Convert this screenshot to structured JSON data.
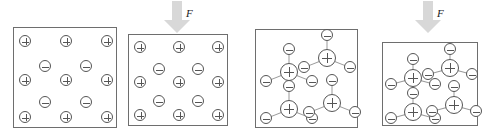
{
  "figure": {
    "background_color": "#ffffff",
    "box_border_color": "#6e6e6e",
    "charge_outline_color": "#555555",
    "bond_color": "#9a9a9a",
    "arrow_color": "#d8d8d8",
    "force_label": "F",
    "symbols": {
      "positive": "plus",
      "negative": "minus"
    }
  },
  "panels": [
    {
      "id": "panel-1",
      "name": "uncompressed-lattice",
      "x": 13,
      "y": 27,
      "width": 104,
      "height": 101,
      "type": "lattice",
      "charges": [
        {
          "sign": "plus",
          "cx": 11,
          "cy": 13,
          "r": 6
        },
        {
          "sign": "plus",
          "cx": 52,
          "cy": 13,
          "r": 6
        },
        {
          "sign": "plus",
          "cx": 93,
          "cy": 13,
          "r": 6
        },
        {
          "sign": "minus",
          "cx": 31,
          "cy": 38,
          "r": 6
        },
        {
          "sign": "minus",
          "cx": 72,
          "cy": 38,
          "r": 6
        },
        {
          "sign": "plus",
          "cx": 11,
          "cy": 52,
          "r": 6
        },
        {
          "sign": "plus",
          "cx": 52,
          "cy": 52,
          "r": 6
        },
        {
          "sign": "plus",
          "cx": 93,
          "cy": 52,
          "r": 6
        },
        {
          "sign": "minus",
          "cx": 31,
          "cy": 74,
          "r": 6
        },
        {
          "sign": "minus",
          "cx": 72,
          "cy": 74,
          "r": 6
        },
        {
          "sign": "plus",
          "cx": 11,
          "cy": 89,
          "r": 6
        },
        {
          "sign": "plus",
          "cx": 52,
          "cy": 89,
          "r": 6
        },
        {
          "sign": "plus",
          "cx": 93,
          "cy": 89,
          "r": 6
        }
      ]
    },
    {
      "id": "panel-2",
      "name": "compressed-lattice",
      "x": 128,
      "y": 34,
      "width": 100,
      "height": 92,
      "type": "lattice",
      "charges": [
        {
          "sign": "plus",
          "cx": 11,
          "cy": 12,
          "r": 6
        },
        {
          "sign": "plus",
          "cx": 50,
          "cy": 12,
          "r": 6
        },
        {
          "sign": "plus",
          "cx": 89,
          "cy": 12,
          "r": 6
        },
        {
          "sign": "minus",
          "cx": 30,
          "cy": 34,
          "r": 6
        },
        {
          "sign": "minus",
          "cx": 69,
          "cy": 34,
          "r": 6
        },
        {
          "sign": "plus",
          "cx": 11,
          "cy": 47,
          "r": 6
        },
        {
          "sign": "plus",
          "cx": 50,
          "cy": 47,
          "r": 6
        },
        {
          "sign": "plus",
          "cx": 89,
          "cy": 47,
          "r": 6
        },
        {
          "sign": "minus",
          "cx": 30,
          "cy": 66,
          "r": 6
        },
        {
          "sign": "minus",
          "cx": 69,
          "cy": 66,
          "r": 6
        },
        {
          "sign": "plus",
          "cx": 11,
          "cy": 80,
          "r": 6
        },
        {
          "sign": "plus",
          "cx": 50,
          "cy": 80,
          "r": 6
        },
        {
          "sign": "plus",
          "cx": 89,
          "cy": 80,
          "r": 6
        }
      ]
    },
    {
      "id": "panel-3",
      "name": "uncompressed-molecules",
      "x": 255,
      "y": 29,
      "width": 103,
      "height": 99,
      "type": "molecules",
      "molecules": [
        {
          "cx": 33,
          "cy": 42,
          "r": 9,
          "ligands": [
            {
              "dx": 0,
              "dy": -23,
              "r": 6
            },
            {
              "dx": -23,
              "dy": 9,
              "r": 6
            },
            {
              "dx": 23,
              "dy": 9,
              "r": 6
            }
          ]
        },
        {
          "cx": 71,
          "cy": 28,
          "r": 9,
          "ligands": [
            {
              "dx": 0,
              "dy": -23,
              "r": 6
            },
            {
              "dx": -23,
              "dy": 9,
              "r": 6
            },
            {
              "dx": 23,
              "dy": 9,
              "r": 6
            }
          ]
        },
        {
          "cx": 33,
          "cy": 79,
          "r": 9,
          "ligands": [
            {
              "dx": 0,
              "dy": -23,
              "r": 6
            },
            {
              "dx": -23,
              "dy": 9,
              "r": 6
            },
            {
              "dx": 23,
              "dy": 9,
              "r": 6
            }
          ]
        },
        {
          "cx": 76,
          "cy": 73,
          "r": 9,
          "ligands": [
            {
              "dx": 0,
              "dy": -23,
              "r": 6
            },
            {
              "dx": -23,
              "dy": 9,
              "r": 6
            },
            {
              "dx": 23,
              "dy": 9,
              "r": 6
            }
          ]
        }
      ]
    },
    {
      "id": "panel-4",
      "name": "compressed-molecules",
      "x": 382,
      "y": 42,
      "width": 96,
      "height": 84,
      "type": "molecules",
      "molecules": [
        {
          "cx": 30,
          "cy": 35,
          "r": 9,
          "ligands": [
            {
              "dx": 0,
              "dy": -19,
              "r": 6
            },
            {
              "dx": -22,
              "dy": 6,
              "r": 6
            },
            {
              "dx": 22,
              "dy": 6,
              "r": 6
            }
          ]
        },
        {
          "cx": 67,
          "cy": 25,
          "r": 9,
          "ligands": [
            {
              "dx": 0,
              "dy": -19,
              "r": 6
            },
            {
              "dx": -22,
              "dy": 6,
              "r": 6
            },
            {
              "dx": 22,
              "dy": 6,
              "r": 6
            }
          ]
        },
        {
          "cx": 30,
          "cy": 69,
          "r": 9,
          "ligands": [
            {
              "dx": 0,
              "dy": -19,
              "r": 6
            },
            {
              "dx": -22,
              "dy": 6,
              "r": 6
            },
            {
              "dx": 22,
              "dy": 6,
              "r": 6
            }
          ]
        },
        {
          "cx": 71,
          "cy": 62,
          "r": 9,
          "ligands": [
            {
              "dx": 0,
              "dy": -19,
              "r": 6
            },
            {
              "dx": -22,
              "dy": 6,
              "r": 6
            },
            {
              "dx": 22,
              "dy": 6,
              "r": 6
            }
          ]
        }
      ]
    }
  ],
  "arrows": [
    {
      "id": "arrow-1",
      "name": "force-arrow-left",
      "x": 164,
      "y": 1,
      "width": 26,
      "height": 32,
      "label": "F",
      "label_x": 186,
      "label_y": 8
    },
    {
      "id": "arrow-2",
      "name": "force-arrow-right",
      "x": 415,
      "y": 1,
      "width": 26,
      "height": 32,
      "label": "F",
      "label_x": 437,
      "label_y": 8
    }
  ]
}
